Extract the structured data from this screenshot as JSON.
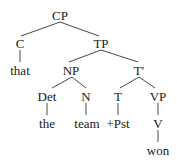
{
  "diagram": {
    "type": "syntax-tree",
    "nodes": {
      "cp": "CP",
      "c": "C",
      "that": "that",
      "tp": "TP",
      "np": "NP",
      "tbar": "T'",
      "det": "Det",
      "the": "the",
      "n": "N",
      "team": "team",
      "t": "T",
      "pst": "+Pst",
      "vp": "VP",
      "v": "V",
      "won": "won"
    },
    "edges": [
      [
        "CP",
        "C"
      ],
      [
        "CP",
        "TP"
      ],
      [
        "C",
        "that"
      ],
      [
        "TP",
        "NP"
      ],
      [
        "TP",
        "T'"
      ],
      [
        "NP",
        "Det"
      ],
      [
        "NP",
        "N"
      ],
      [
        "Det",
        "the"
      ],
      [
        "N",
        "team"
      ],
      [
        "T'",
        "T"
      ],
      [
        "T'",
        "VP"
      ],
      [
        "T",
        "+Pst"
      ],
      [
        "VP",
        "V"
      ],
      [
        "V",
        "won"
      ]
    ]
  }
}
